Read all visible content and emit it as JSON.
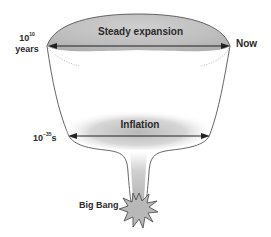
{
  "diagram": {
    "type": "cosmic-expansion-funnel",
    "labels": {
      "steady_expansion": "Steady expansion",
      "inflation": "Inflation",
      "big_bang": "Big Bang",
      "now": "Now",
      "top_time_base": "10",
      "top_time_exp": "10",
      "top_time_unit": "years",
      "inflation_time_base": "10",
      "inflation_time_exp": "−35",
      "inflation_time_unit": "s"
    },
    "colors": {
      "outline": "#555555",
      "fill_gray": "#bdbdbd",
      "arrow": "#222222",
      "text": "#2a2a2a"
    }
  }
}
